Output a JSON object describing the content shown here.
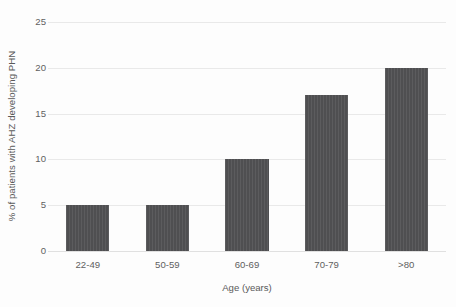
{
  "chart_data": {
    "type": "bar",
    "title": "",
    "categories": [
      "22-49",
      "50-59",
      "60-69",
      "70-79",
      ">80"
    ],
    "values": [
      5,
      5,
      10,
      17,
      20
    ],
    "series": [
      {
        "name": "% of patients with AHZ developing PHN",
        "values": [
          5,
          5,
          10,
          17,
          20
        ]
      }
    ],
    "xlabel": "Age (years)",
    "ylabel": "% of patients with AHZ developing PHN",
    "ylim": [
      0,
      25
    ],
    "yticks": [
      0,
      5,
      10,
      15,
      20,
      25
    ],
    "ytick_labels": [
      "0",
      "5",
      "10",
      "15",
      "20",
      "25"
    ],
    "grid": "horizontal",
    "legend": "none",
    "bar_color": "#535355",
    "gridline_color": "#e9e9e9",
    "text_color": "#5a5a5a",
    "background_color": "#fdfdfd"
  }
}
